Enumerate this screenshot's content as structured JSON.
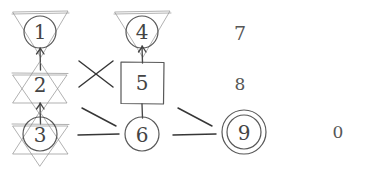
{
  "canvas": {
    "width": 366,
    "height": 171,
    "background_color": "#ffffff",
    "ink_color": "#4a4a4a",
    "medium": "hand-drawn pencil sketch"
  },
  "nodes": [
    {
      "id": "node-1",
      "label": "1",
      "shape": "circle-in-downward-triangle",
      "column": "left",
      "cx": 40,
      "cy": 32,
      "radius": 16
    },
    {
      "id": "node-2",
      "label": "2",
      "shape": "star-of-david",
      "column": "left",
      "cx": 40,
      "cy": 83,
      "radius": 16
    },
    {
      "id": "node-3",
      "label": "3",
      "shape": "circle-in-star-of-david",
      "column": "left",
      "cx": 40,
      "cy": 134,
      "radius": 17
    },
    {
      "id": "node-4",
      "label": "4",
      "shape": "circle-in-downward-triangle",
      "column": "middle",
      "cx": 142,
      "cy": 32,
      "radius": 16
    },
    {
      "id": "node-5",
      "label": "5",
      "shape": "square",
      "column": "middle",
      "cx": 142,
      "cy": 83,
      "radius": 21
    },
    {
      "id": "node-6",
      "label": "6",
      "shape": "circle",
      "column": "middle",
      "cx": 142,
      "cy": 134,
      "radius": 17
    },
    {
      "id": "node-7",
      "label": "7",
      "shape": "none",
      "column": "right",
      "cx": 240,
      "cy": 35,
      "radius": 0
    },
    {
      "id": "node-8",
      "label": "8",
      "shape": "none",
      "column": "right",
      "cx": 240,
      "cy": 85,
      "radius": 0
    },
    {
      "id": "node-9",
      "label": "9",
      "shape": "double-circle",
      "column": "right",
      "cx": 244,
      "cy": 132,
      "radius": 19
    },
    {
      "id": "node-0",
      "label": "0",
      "shape": "none",
      "column": "far-right",
      "cx": 338,
      "cy": 133,
      "radius": 0
    }
  ],
  "connectors": [
    {
      "id": "conn-1-2",
      "from": "node-1",
      "to": "node-2",
      "kind": "vertical-arrow"
    },
    {
      "id": "conn-2-3",
      "from": "node-2",
      "to": "node-3",
      "kind": "vertical-arrow"
    },
    {
      "id": "conn-4-5",
      "from": "node-4",
      "to": "node-5",
      "kind": "vertical-arrow"
    },
    {
      "id": "conn-5-6",
      "from": "node-5",
      "to": "node-6",
      "kind": "vertical-arrow"
    },
    {
      "id": "conn-cross-left",
      "from": "left-column",
      "to": "middle-column",
      "kind": "x-cross"
    },
    {
      "id": "conn-diag-left",
      "from": "left-column",
      "to": "middle-column",
      "kind": "diagonal"
    },
    {
      "id": "conn-horiz-left",
      "from": "node-3",
      "to": "node-6",
      "kind": "horizontal"
    },
    {
      "id": "conn-diag-right",
      "from": "middle-column",
      "to": "right-column",
      "kind": "diagonal"
    },
    {
      "id": "conn-horiz-right",
      "from": "node-6",
      "to": "node-9",
      "kind": "horizontal"
    }
  ],
  "labels": {
    "one": "1",
    "two": "2",
    "three": "3",
    "four": "4",
    "five": "5",
    "six": "6",
    "seven": "7",
    "eight": "8",
    "nine": "9",
    "zero": "0"
  }
}
